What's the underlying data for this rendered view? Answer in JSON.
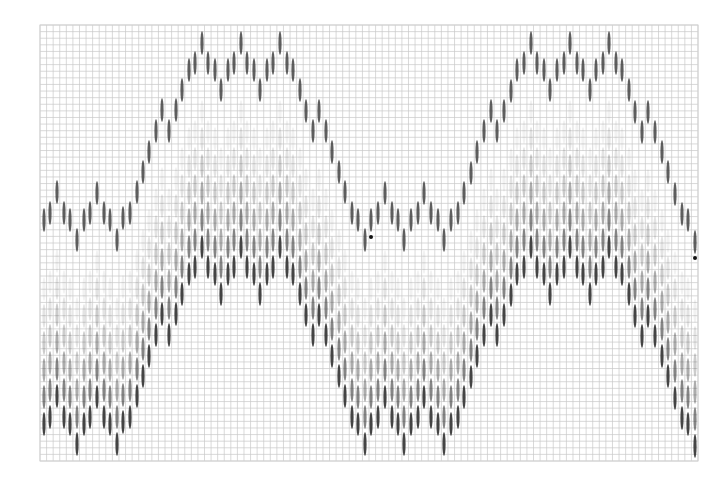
{
  "figure": {
    "width": 708,
    "height": 483,
    "background": "#ffffff",
    "grid": {
      "x0": 40,
      "y0": 25,
      "x1": 698,
      "y1": 461,
      "cols": 100,
      "rows": 66,
      "color": "#c9c9c9",
      "border_color": "#d2d2d2"
    },
    "ellipse": {
      "rx": 1.6,
      "ry": 12,
      "color": "#3a3a3a"
    },
    "top_series": {
      "opacity": 0.82,
      "points": [
        [
          44,
          220
        ],
        [
          50,
          213
        ],
        [
          57,
          192
        ],
        [
          64,
          213
        ],
        [
          70,
          220
        ],
        [
          77,
          240
        ],
        [
          84,
          220
        ],
        [
          90,
          213
        ],
        [
          97,
          193
        ],
        [
          104,
          213
        ],
        [
          110,
          220
        ],
        [
          117,
          240
        ],
        [
          123,
          218
        ],
        [
          130,
          213
        ],
        [
          137,
          192
        ],
        [
          143,
          172
        ],
        [
          149,
          152
        ],
        [
          156,
          131
        ],
        [
          162,
          110
        ],
        [
          169,
          131
        ],
        [
          176,
          110
        ],
        [
          182,
          90
        ],
        [
          189,
          70
        ],
        [
          195,
          63
        ],
        [
          202,
          43
        ],
        [
          208,
          63
        ],
        [
          215,
          70
        ],
        [
          221,
          90
        ],
        [
          228,
          70
        ],
        [
          234,
          63
        ],
        [
          241,
          43
        ],
        [
          247,
          63
        ],
        [
          254,
          70
        ],
        [
          260,
          90
        ],
        [
          267,
          70
        ],
        [
          273,
          63
        ],
        [
          280,
          43
        ],
        [
          287,
          63
        ],
        [
          293,
          70
        ],
        [
          300,
          90
        ],
        [
          306,
          111
        ],
        [
          313,
          131
        ],
        [
          319,
          111
        ],
        [
          326,
          131
        ],
        [
          332,
          152
        ],
        [
          339,
          172
        ],
        [
          345,
          192
        ],
        [
          352,
          213
        ],
        [
          358,
          220
        ],
        [
          365,
          240
        ],
        [
          371,
          220
        ],
        [
          378,
          213
        ],
        [
          385,
          193
        ],
        [
          392,
          213
        ],
        [
          398,
          220
        ],
        [
          404,
          240
        ],
        [
          411,
          220
        ],
        [
          418,
          213
        ],
        [
          424,
          193
        ],
        [
          431,
          213
        ],
        [
          438,
          220
        ],
        [
          444,
          240
        ],
        [
          451,
          220
        ],
        [
          458,
          213
        ],
        [
          464,
          193
        ],
        [
          471,
          173
        ],
        [
          477,
          152
        ],
        [
          484,
          131
        ],
        [
          491,
          111
        ],
        [
          497,
          131
        ],
        [
          504,
          111
        ],
        [
          511,
          91
        ],
        [
          517,
          70
        ],
        [
          524,
          63
        ],
        [
          531,
          43
        ],
        [
          537,
          63
        ],
        [
          544,
          70
        ],
        [
          550,
          90
        ],
        [
          557,
          70
        ],
        [
          564,
          63
        ],
        [
          570,
          43
        ],
        [
          577,
          63
        ],
        [
          583,
          70
        ],
        [
          590,
          90
        ],
        [
          596,
          70
        ],
        [
          603,
          63
        ],
        [
          609,
          43
        ],
        [
          616,
          63
        ],
        [
          622,
          70
        ],
        [
          629,
          90
        ],
        [
          635,
          112
        ],
        [
          642,
          132
        ],
        [
          648,
          112
        ],
        [
          655,
          132
        ],
        [
          662,
          152
        ],
        [
          668,
          172
        ],
        [
          675,
          194
        ],
        [
          682,
          214
        ],
        [
          688,
          220
        ],
        [
          695,
          242
        ]
      ]
    },
    "lower_stack": {
      "offset_y": 204,
      "lane_spacing": 27,
      "lane_opacities": [
        0.95,
        0.62,
        0.42,
        0.26,
        0.14,
        0.07
      ]
    },
    "markers": [
      {
        "x": 371,
        "y": 237,
        "r": 2,
        "color": "#111111"
      },
      {
        "x": 695,
        "y": 258,
        "r": 2,
        "color": "#111111"
      }
    ]
  }
}
